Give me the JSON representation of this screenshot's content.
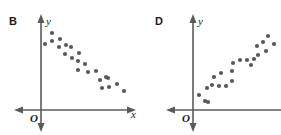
{
  "figure": {
    "width": 281,
    "height": 135,
    "background": "#ffffff",
    "dot_color": "#595959",
    "axis_color": "#5a5a5a",
    "text_color": "#1a1a1a",
    "dot_radius": 2.1
  },
  "panels": [
    {
      "id": "panel-b",
      "letter": "B",
      "letter_pos": {
        "x": 9,
        "y": 25
      },
      "origin_label": "O",
      "origin_pos": {
        "x": 31,
        "y": 121
      },
      "y_axis_label": "y",
      "y_axis_label_pos": {
        "x": 47,
        "y": 24
      },
      "x_axis_label": "x",
      "x_axis_label_pos": {
        "x": 131,
        "y": 117
      },
      "axes": {
        "origin": {
          "x": 41,
          "y": 110
        },
        "x_axis": {
          "x1": 20,
          "y1": 110,
          "x2": 130,
          "y2": 110
        },
        "y_axis": {
          "x1": 41,
          "y1": 17,
          "x2": 41,
          "y2": 128
        }
      },
      "chart_data": {
        "type": "scatter",
        "title": "B",
        "xlabel": "x",
        "ylabel": "y",
        "grid": false,
        "legend": null,
        "trend": "negative",
        "description": "Scatter plot showing a strong negative linear association between x and y",
        "n_points": 22,
        "points": [
          {
            "x": 45,
            "y": 44
          },
          {
            "x": 52,
            "y": 33
          },
          {
            "x": 52,
            "y": 41
          },
          {
            "x": 59,
            "y": 47
          },
          {
            "x": 60,
            "y": 39
          },
          {
            "x": 65,
            "y": 54
          },
          {
            "x": 66,
            "y": 45
          },
          {
            "x": 71,
            "y": 47
          },
          {
            "x": 72,
            "y": 58
          },
          {
            "x": 78,
            "y": 61
          },
          {
            "x": 79,
            "y": 53
          },
          {
            "x": 85,
            "y": 64
          },
          {
            "x": 78,
            "y": 70
          },
          {
            "x": 88,
            "y": 72
          },
          {
            "x": 96,
            "y": 71
          },
          {
            "x": 100,
            "y": 80
          },
          {
            "x": 106,
            "y": 77
          },
          {
            "x": 108,
            "y": 78
          },
          {
            "x": 102,
            "y": 88
          },
          {
            "x": 109,
            "y": 87
          },
          {
            "x": 117,
            "y": 84
          },
          {
            "x": 124,
            "y": 91
          }
        ]
      }
    },
    {
      "id": "panel-d",
      "letter": "D",
      "letter_pos": {
        "x": 155,
        "y": 25
      },
      "origin_label": "O",
      "origin_pos": {
        "x": 183,
        "y": 121
      },
      "y_axis_label": "y",
      "y_axis_label_pos": {
        "x": 199,
        "y": 24
      },
      "x_axis_label": "",
      "x_axis_label_pos": {
        "x": 0,
        "y": 0
      },
      "axes": {
        "origin": {
          "x": 193,
          "y": 110
        },
        "x_axis": {
          "x1": 172,
          "y1": 110,
          "x2": 281,
          "y2": 110
        },
        "y_axis": {
          "x1": 193,
          "y1": 17,
          "x2": 193,
          "y2": 128
        }
      },
      "chart_data": {
        "type": "scatter",
        "title": "D",
        "xlabel": "",
        "ylabel": "y",
        "grid": false,
        "legend": null,
        "trend": "positive",
        "description": "Scatter plot showing a strong positive linear association between x and y",
        "n_points": 22,
        "points": [
          {
            "x": 199,
            "y": 95
          },
          {
            "x": 205,
            "y": 101
          },
          {
            "x": 208,
            "y": 102
          },
          {
            "x": 207,
            "y": 88
          },
          {
            "x": 212,
            "y": 85
          },
          {
            "x": 219,
            "y": 86
          },
          {
            "x": 214,
            "y": 77
          },
          {
            "x": 221,
            "y": 73
          },
          {
            "x": 226,
            "y": 86
          },
          {
            "x": 232,
            "y": 81
          },
          {
            "x": 232,
            "y": 71
          },
          {
            "x": 233,
            "y": 63
          },
          {
            "x": 240,
            "y": 60
          },
          {
            "x": 247,
            "y": 60
          },
          {
            "x": 254,
            "y": 59
          },
          {
            "x": 251,
            "y": 65
          },
          {
            "x": 258,
            "y": 55
          },
          {
            "x": 257,
            "y": 46
          },
          {
            "x": 263,
            "y": 42
          },
          {
            "x": 266,
            "y": 51
          },
          {
            "x": 268,
            "y": 36
          },
          {
            "x": 274,
            "y": 44
          }
        ]
      }
    }
  ]
}
